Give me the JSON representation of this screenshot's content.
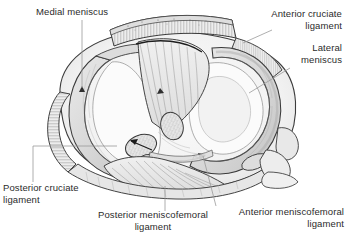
{
  "figure": {
    "colors": {
      "text": "#2b2b2b",
      "leader_line": "#8a8a8a",
      "outline": "#3a3a3a",
      "fill_light": "#f4f4f4",
      "fill_mid": "#e2e2e2",
      "fill_shade": "#cfcfcf",
      "hatch": "#9a9a9a",
      "background": "#ffffff"
    }
  },
  "labels": {
    "medial_meniscus": "Medial meniscus",
    "anterior_cruciate_ligament": "Anterior cruciate\nligament",
    "lateral_meniscus": "Lateral\nmeniscus",
    "posterior_cruciate_ligament": "Posterior cruciate\nligament",
    "posterior_meniscofemoral_ligament": "Posterior meniscofemoral\nligament",
    "anterior_meniscofemoral_ligament": "Anterior meniscofemoral\nligament"
  },
  "structures": [
    {
      "name": "medial-meniscus",
      "label": "Medial meniscus",
      "shape": "c-shaped-crescent",
      "side": "left"
    },
    {
      "name": "lateral-meniscus",
      "label": "Lateral meniscus",
      "shape": "o-shaped-ring",
      "side": "right"
    },
    {
      "name": "anterior-cruciate-ligament",
      "label": "Anterior cruciate ligament",
      "shape": "fibrous-band",
      "side": "anterior"
    },
    {
      "name": "posterior-cruciate-ligament",
      "label": "Posterior cruciate ligament",
      "shape": "stippled-oval",
      "side": "posterior"
    },
    {
      "name": "anterior-meniscofemoral-ligament",
      "label": "Anterior meniscofemoral ligament",
      "shape": "cord",
      "side": "posterior-right"
    },
    {
      "name": "posterior-meniscofemoral-ligament",
      "label": "Posterior meniscofemoral ligament",
      "shape": "fiber-fan",
      "side": "posterior"
    }
  ]
}
